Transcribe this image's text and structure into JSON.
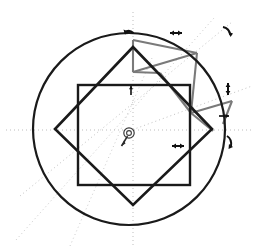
{
  "canvas": {
    "width": 256,
    "height": 250,
    "background": "#ffffff",
    "title": "Geometric construction canvas"
  },
  "palette": {
    "stroke_dark": "#1a1a1a",
    "stroke_gray": "#7a7a7a",
    "guide_light": "#c9c9c9",
    "guide_axis": "#b5b5b5",
    "handle_dark": "#111111",
    "white": "#ffffff"
  },
  "shapes": {
    "circle": {
      "name": "outer-circle",
      "cx": 129,
      "cy": 129,
      "r": 96,
      "stroke": "#1a1a1a",
      "stroke_width": 2.2,
      "fill": "none"
    },
    "square": {
      "name": "axis-aligned-square",
      "x": 78,
      "y": 85,
      "width": 112,
      "height": 100,
      "stroke": "#1a1a1a",
      "stroke_width": 2.4,
      "fill": "none"
    },
    "diamond": {
      "name": "rotated-square-diamond",
      "rotation_deg": 45,
      "points": "133,47 212,129 133,205 55,129",
      "stroke": "#1a1a1a",
      "stroke_width": 2.6,
      "fill": "none"
    },
    "gray_polygon": {
      "name": "gray-overlay-polygon",
      "points": "133,40 196,54 231,118 196,140 160,74",
      "stroke": "#7a7a7a",
      "stroke_width": 2.2,
      "fill": "none"
    },
    "gray_segments": [
      {
        "name": "gray-segment-top-left",
        "x1": 133,
        "y1": 40,
        "x2": 133,
        "y2": 72
      },
      {
        "name": "gray-segment-fan-a",
        "x1": 133,
        "y1": 72,
        "x2": 196,
        "y2": 54
      },
      {
        "name": "gray-segment-fan-b",
        "x1": 196,
        "y1": 54,
        "x2": 190,
        "y2": 112
      },
      {
        "name": "gray-segment-fan-c",
        "x1": 160,
        "y1": 74,
        "x2": 190,
        "y2": 112
      },
      {
        "name": "gray-segment-fan-d",
        "x1": 190,
        "y1": 112,
        "x2": 231,
        "y2": 102
      },
      {
        "name": "gray-segment-fan-e",
        "x1": 190,
        "y1": 112,
        "x2": 212,
        "y2": 129
      },
      {
        "name": "gray-segment-right-arc",
        "x1": 231,
        "y1": 102,
        "x2": 222,
        "y2": 122
      }
    ]
  },
  "guides": {
    "horizontal_axis": {
      "name": "horizontal-guide",
      "x1": 8,
      "y1": 129,
      "x2": 250,
      "y2": 129
    },
    "vertical_axis": {
      "name": "vertical-guide",
      "x1": 133,
      "y1": 14,
      "x2": 133,
      "y2": 244
    },
    "diagonals": [
      {
        "name": "diagonal-guide-ne",
        "x1": 20,
        "y1": 196,
        "x2": 232,
        "y2": 22
      },
      {
        "name": "diagonal-guide-se",
        "x1": 16,
        "y1": 240,
        "x2": 214,
        "y2": 18
      },
      {
        "name": "diagonal-guide-ray",
        "x1": 129,
        "y1": 129,
        "x2": 250,
        "y2": 88
      },
      {
        "name": "diagonal-guide-low",
        "x1": 70,
        "y1": 246,
        "x2": 150,
        "y2": 60
      }
    ],
    "dash_pattern": "1 3",
    "stroke": "#c2c2c2"
  },
  "handles": [
    {
      "name": "rotation-handle-top",
      "x": 128,
      "y": 33,
      "glyph": "↶",
      "rotate": 0,
      "size": 9
    },
    {
      "name": "move-handle-top-right",
      "x": 176,
      "y": 33,
      "glyph": "↔",
      "rotate": 0,
      "size": 8
    },
    {
      "name": "rotation-handle-upper-right",
      "x": 228,
      "y": 30,
      "glyph": "↷",
      "rotate": 0,
      "size": 9
    },
    {
      "name": "resize-handle-right-top",
      "x": 228,
      "y": 88,
      "glyph": "↕",
      "rotate": 0,
      "size": 8
    },
    {
      "name": "move-handle-square-top",
      "x": 131,
      "y": 90,
      "glyph": "↕",
      "rotate": 0,
      "size": 7
    },
    {
      "name": "move-handle-right-mid",
      "x": 224,
      "y": 116,
      "glyph": "↔",
      "rotate": 0,
      "size": 7
    },
    {
      "name": "move-handle-center-right",
      "x": 178,
      "y": 145,
      "glyph": "↔",
      "rotate": 0,
      "size": 8
    },
    {
      "name": "rotation-handle-right-bottom",
      "x": 230,
      "y": 141,
      "glyph": "↷",
      "rotate": 0,
      "size": 8
    }
  ],
  "anchor": {
    "name": "center-anchor-point",
    "cx": 129,
    "cy": 133,
    "r_outer": 5.2,
    "r_inner": 2.4,
    "stroke": "#3a3a3a",
    "tail": {
      "x1": 127,
      "y1": 136,
      "x2": 121,
      "y2": 146
    }
  }
}
